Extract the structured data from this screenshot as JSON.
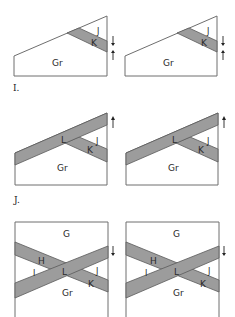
{
  "figure_labels": {
    "panel_i": "I.",
    "panel_j": "J."
  },
  "colors": {
    "band_fill": "#9c9c9c",
    "band_edge": "#5a5a5a",
    "outline": "#6e6e6e",
    "background": "#ffffff"
  },
  "panels": {
    "i_left": {
      "regions": {
        "gr": "Gr",
        "k": "K",
        "j": "J"
      },
      "arrows": "converging-down-up"
    },
    "i_right": {
      "regions": {
        "gr": "Gr",
        "k": "K",
        "j": "J"
      },
      "arrows": "converging-down-up"
    },
    "j_left": {
      "regions": {
        "gr": "Gr",
        "k": "K",
        "j": "J",
        "l": "L"
      },
      "arrows": "up"
    },
    "j_right": {
      "regions": {
        "gr": "Gr",
        "k": "K",
        "j": "J",
        "l": "L"
      },
      "arrows": "up"
    },
    "k_left": {
      "regions": {
        "g": "G",
        "h": "H",
        "i": "I",
        "l": "L",
        "j": "J",
        "k": "K",
        "gr": "Gr"
      },
      "arrows": "down"
    },
    "k_right": {
      "regions": {
        "g": "G",
        "h": "H",
        "i": "I",
        "l": "L",
        "j": "J",
        "k": "K",
        "gr": "Gr"
      },
      "arrows": "down"
    }
  }
}
